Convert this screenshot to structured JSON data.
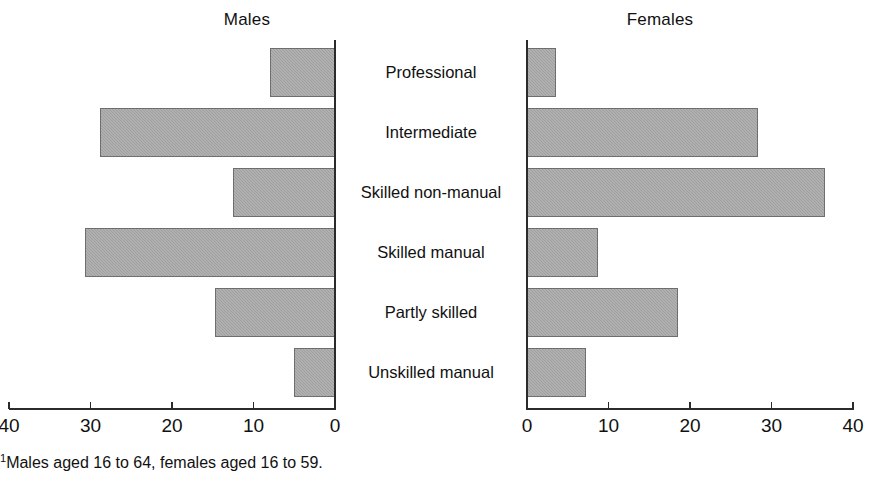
{
  "chart_data": {
    "type": "bar",
    "subtype": "bidirectional-population-pyramid",
    "title": "",
    "orientation": "horizontal",
    "categories": [
      "Professional",
      "Intermediate",
      "Skilled non-manual",
      "Skilled manual",
      "Partly skilled",
      "Unskilled manual"
    ],
    "series": [
      {
        "name": "Males",
        "direction": "left",
        "values": [
          8.0,
          28.8,
          12.5,
          30.7,
          14.7,
          5.0
        ]
      },
      {
        "name": "Females",
        "direction": "right",
        "values": [
          3.5,
          28.3,
          36.6,
          8.7,
          18.5,
          7.3
        ]
      }
    ],
    "xlabel": "",
    "ylabel": "",
    "xlim_left": [
      40,
      0
    ],
    "xlim_right": [
      0,
      40
    ],
    "left_ticks": [
      40,
      30,
      20,
      10,
      0
    ],
    "right_ticks": [
      0,
      10,
      20,
      30,
      40
    ],
    "grid": false,
    "legend": "panel-titles",
    "bar_color": "#a6a6a6",
    "bar_edge_color": "#6e6e6e",
    "axis_color": "#2b2b2b"
  },
  "panels": {
    "left_title": "Males",
    "right_title": "Females"
  },
  "footnote": {
    "marker": "1",
    "text": "Males aged 16 to 64, females aged 16 to 59."
  }
}
